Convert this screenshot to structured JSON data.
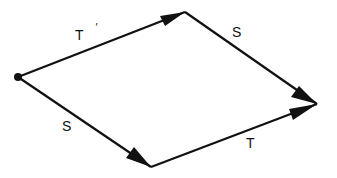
{
  "diagram": {
    "type": "commutative-parallelogram",
    "stroke_color": "#111111",
    "background": "#ffffff",
    "nodes": [
      {
        "id": "origin",
        "x": 18,
        "y": 77,
        "marked": true
      },
      {
        "id": "top",
        "x": 185,
        "y": 12
      },
      {
        "id": "right",
        "x": 317,
        "y": 104
      },
      {
        "id": "bottom",
        "x": 151,
        "y": 167
      }
    ],
    "edges": [
      {
        "from": "origin",
        "to": "top",
        "label": "T",
        "prime": "′"
      },
      {
        "from": "top",
        "to": "right",
        "label": "S"
      },
      {
        "from": "origin",
        "to": "bottom",
        "label": "S"
      },
      {
        "from": "bottom",
        "to": "right",
        "label": "T"
      }
    ]
  }
}
